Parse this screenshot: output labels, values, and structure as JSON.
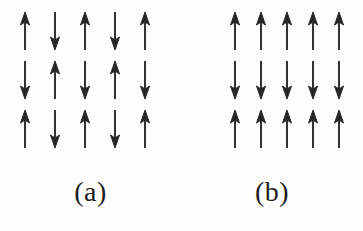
{
  "figure": {
    "type": "spin-configuration-diagram",
    "background_color": "#fdfdfb",
    "arrow_color": "#262626",
    "panels": [
      {
        "id": "a",
        "label": "(a)",
        "label_text": "(a)",
        "order_type": "checkerboard-antiferromagnet",
        "rows": 3,
        "columns": 5,
        "spins": [
          [
            "up",
            "down",
            "up",
            "down",
            "up"
          ],
          [
            "down",
            "up",
            "down",
            "up",
            "down"
          ],
          [
            "up",
            "down",
            "up",
            "down",
            "up"
          ]
        ],
        "spin_values": [
          [
            1,
            -1,
            1,
            -1,
            1
          ],
          [
            -1,
            1,
            -1,
            1,
            -1
          ],
          [
            1,
            -1,
            1,
            -1,
            1
          ]
        ],
        "arrow_glyphs": [
          [
            "↑",
            "↓",
            "↑",
            "↓",
            "↑"
          ],
          [
            "↓",
            "↑",
            "↓",
            "↑",
            "↓"
          ],
          [
            "↑",
            "↓",
            "↑",
            "↓",
            "↑"
          ]
        ],
        "net_magnetization": 1,
        "column_spacing_px": 30,
        "row_spacing_px": 49
      },
      {
        "id": "b",
        "label": "(b)",
        "label_text": "(b)",
        "order_type": "layered-striped-antiferromagnet",
        "rows": 3,
        "columns": 5,
        "spins": [
          [
            "up",
            "up",
            "up",
            "up",
            "up"
          ],
          [
            "down",
            "down",
            "down",
            "down",
            "down"
          ],
          [
            "up",
            "up",
            "up",
            "up",
            "up"
          ]
        ],
        "spin_values": [
          [
            1,
            1,
            1,
            1,
            1
          ],
          [
            -1,
            -1,
            -1,
            -1,
            -1
          ],
          [
            1,
            1,
            1,
            1,
            1
          ]
        ],
        "arrow_glyphs": [
          [
            "↑",
            "↑",
            "↑",
            "↑",
            "↑"
          ],
          [
            "↓",
            "↓",
            "↓",
            "↓",
            "↓"
          ],
          [
            "↑",
            "↑",
            "↑",
            "↑",
            "↑"
          ]
        ],
        "net_magnetization": 5,
        "column_spacing_px": 26,
        "row_spacing_px": 49
      }
    ]
  }
}
